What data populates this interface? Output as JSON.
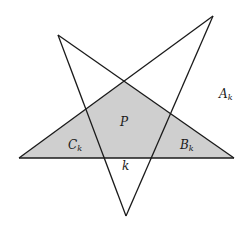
{
  "diagram": {
    "colors": {
      "stroke": "#1a1a1a",
      "fill": "#cfcfcf",
      "background": "#ffffff"
    },
    "labels": {
      "A": {
        "main": "A",
        "sub": "k"
      },
      "B": {
        "main": "B",
        "sub": "k"
      },
      "C": {
        "main": "C",
        "sub": "k"
      },
      "P": {
        "main": "P"
      },
      "k": {
        "main": "k"
      }
    }
  }
}
